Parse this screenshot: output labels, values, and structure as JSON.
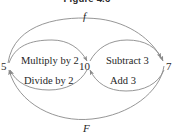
{
  "figure": {
    "title": "Figure 4.6",
    "nodes": [
      {
        "id": "n5",
        "label": "5",
        "name": "node-value-5"
      },
      {
        "id": "n10",
        "label": "10",
        "name": "node-value-10"
      },
      {
        "id": "n7",
        "label": "7",
        "name": "node-value-7"
      }
    ],
    "edges": [
      {
        "id": "e1",
        "label": "Multiply by 2",
        "from": "5",
        "to": "10"
      },
      {
        "id": "e2",
        "label": "Subtract 3",
        "from": "10",
        "to": "7"
      },
      {
        "id": "e3",
        "label": "Divide by 2",
        "from": "10",
        "to": "5"
      },
      {
        "id": "e4",
        "label": "Add 3",
        "from": "7",
        "to": "10"
      }
    ],
    "composite_curves": [
      {
        "id": "c1",
        "label": "f",
        "from": "5",
        "to": "7",
        "position": "top"
      },
      {
        "id": "c2",
        "label": "F",
        "from": "7",
        "to": "5",
        "position": "bottom"
      }
    ],
    "colors": {
      "stroke": "#8a8a8a",
      "text": "#262626",
      "background": "#ffffff"
    }
  }
}
